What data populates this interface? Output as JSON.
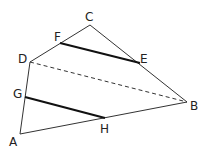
{
  "diagram": {
    "type": "quadrilateral",
    "vertices": {
      "A": {
        "label": "A",
        "x": 20,
        "y": 134
      },
      "B": {
        "label": "B",
        "x": 187,
        "y": 102
      },
      "C": {
        "label": "C",
        "x": 90,
        "y": 25
      },
      "D": {
        "label": "D",
        "x": 30,
        "y": 62
      }
    },
    "points": {
      "E": {
        "label": "E",
        "x": 140,
        "y": 63,
        "on": "CB"
      },
      "F": {
        "label": "F",
        "x": 60,
        "y": 43,
        "on": "DC"
      },
      "G": {
        "label": "G",
        "x": 25,
        "y": 97,
        "on": "AD"
      },
      "H": {
        "label": "H",
        "x": 105,
        "y": 118,
        "on": "AB"
      }
    },
    "segments": [
      {
        "name": "FE",
        "style": "bold"
      },
      {
        "name": "GH",
        "style": "bold"
      },
      {
        "name": "DB",
        "style": "dashed"
      }
    ],
    "colors": {
      "stroke": "#333333",
      "bold": "#111111",
      "label": "#222222"
    }
  }
}
